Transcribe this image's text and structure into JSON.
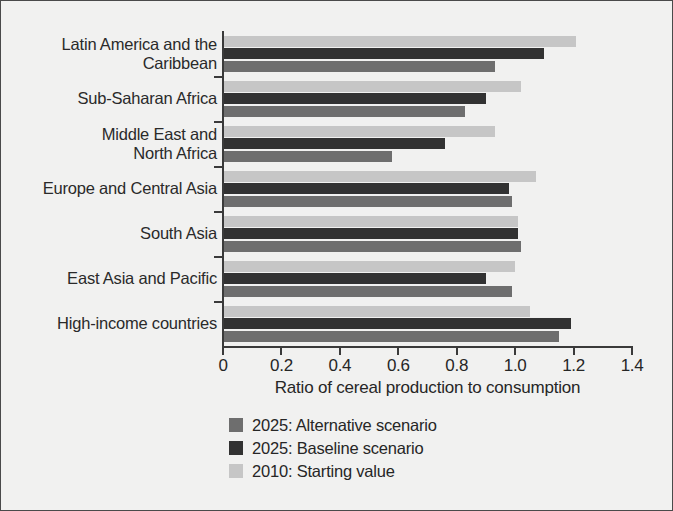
{
  "chart_data": {
    "type": "bar",
    "orientation": "horizontal",
    "title": "",
    "xlabel": "Ratio of cereal production to consumption",
    "ylabel": "",
    "xlim": [
      0,
      1.4
    ],
    "xticks": [
      "0",
      "0.2",
      "0.4",
      "0.6",
      "0.8",
      "1.0",
      "1.2",
      "1.4"
    ],
    "xtick_values": [
      0,
      0.2,
      0.4,
      0.6,
      0.8,
      1.0,
      1.2,
      1.4
    ],
    "grid": false,
    "legend_position": "bottom-left",
    "categories": [
      "Latin America and the Caribbean",
      "Sub-Saharan Africa",
      "Middle East and North Africa",
      "Europe and Central Asia",
      "South Asia",
      "East Asia and Pacific",
      "High-income countries"
    ],
    "category_lines": [
      [
        "Latin America and the",
        "Caribbean"
      ],
      [
        "Sub-Saharan Africa"
      ],
      [
        "Middle East and",
        "North Africa"
      ],
      [
        "Europe and Central Asia"
      ],
      [
        "South Asia"
      ],
      [
        "East Asia and Pacific"
      ],
      [
        "High-income countries"
      ]
    ],
    "series": [
      {
        "name": "2025: Alternative scenario",
        "color": "#6e6e6e",
        "values": [
          0.93,
          0.83,
          0.58,
          0.99,
          1.02,
          0.99,
          1.15
        ]
      },
      {
        "name": "2025: Baseline scenario",
        "color": "#323232",
        "values": [
          1.1,
          0.9,
          0.76,
          0.98,
          1.01,
          0.9,
          1.19
        ]
      },
      {
        "name": "2010: Starting value",
        "color": "#c6c6c6",
        "values": [
          1.21,
          1.02,
          0.93,
          1.07,
          1.01,
          1.0,
          1.05
        ]
      }
    ]
  },
  "legend": {
    "items": [
      {
        "label": "2025: Alternative scenario",
        "color": "#6e6e6e"
      },
      {
        "label": "2025: Baseline scenario",
        "color": "#323232"
      },
      {
        "label": "2010: Starting value",
        "color": "#c6c6c6"
      }
    ]
  }
}
